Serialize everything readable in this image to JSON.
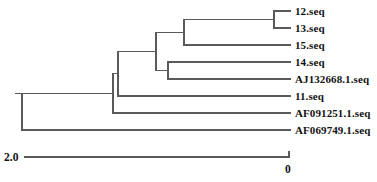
{
  "figure": {
    "type": "phylogenetic-tree",
    "orientation": "right-to-left",
    "line_color": "#5a5a5a",
    "text_color": "#111111",
    "background": "#ffffff"
  },
  "taxa": [
    {
      "label": "12.seq",
      "row": 0
    },
    {
      "label": "13.seq",
      "row": 1
    },
    {
      "label": "15.seq",
      "row": 2
    },
    {
      "label": "14.seq",
      "row": 3
    },
    {
      "label": "AJ132668.1.seq",
      "row": 4
    },
    {
      "label": "11.seq",
      "row": 5
    },
    {
      "label": "AF091251.1.seq",
      "row": 6
    },
    {
      "label": "AF069749.1.seq",
      "row": 7
    }
  ],
  "scale": {
    "left_label": "2.0",
    "right_label": "0",
    "left_x": 25,
    "right_x": 289,
    "y": 157
  },
  "chart_data": {
    "type": "tree",
    "title": "",
    "xlabel": "",
    "ylabel": "",
    "axis_direction": "decreasing-left-to-right",
    "axis_range": [
      2.0,
      0
    ],
    "tip_labels": [
      "12.seq",
      "13.seq",
      "15.seq",
      "14.seq",
      "AJ132668.1.seq",
      "11.seq",
      "AF091251.1.seq",
      "AF069749.1.seq"
    ],
    "tip_x_px": 290,
    "tip_y_px": [
      11,
      28,
      45,
      62,
      79,
      96,
      113,
      130
    ],
    "nodes": [
      {
        "name": "n-12-13",
        "x_px": 274,
        "children_rows": [
          0,
          1
        ]
      },
      {
        "name": "n-12-13-15",
        "x_px": 184,
        "children": [
          "n-12-13",
          "15.seq"
        ]
      },
      {
        "name": "n-14-AJ132668",
        "x_px": 168,
        "children_rows": [
          3,
          4
        ]
      },
      {
        "name": "n-upper-clade",
        "x_px": 156,
        "children": [
          "n-12-13-15",
          "n-14-AJ132668"
        ]
      },
      {
        "name": "n-with-11",
        "x_px": 118,
        "children": [
          "n-upper-clade",
          "11.seq"
        ]
      },
      {
        "name": "n-with-AF091251",
        "x_px": 113,
        "children": [
          "n-with-11",
          "AF091251.1.seq"
        ]
      },
      {
        "name": "root",
        "x_px": 22,
        "children": [
          "n-with-AF091251",
          "AF069749.1.seq"
        ]
      }
    ],
    "root_stub_x_px": 16
  }
}
